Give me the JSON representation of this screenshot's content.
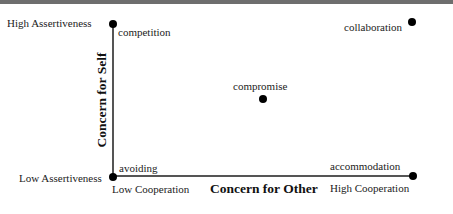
{
  "diagram": {
    "y_axis": {
      "title": "Concern for Self",
      "high_label": "High Assertiveness",
      "low_label": "Low Assertiveness"
    },
    "x_axis": {
      "title": "Concern for Other",
      "low_label": "Low Cooperation",
      "high_label": "High Cooperation"
    },
    "points": [
      {
        "name": "competition",
        "x": 0,
        "y": 1
      },
      {
        "name": "collaboration",
        "x": 1,
        "y": 1
      },
      {
        "name": "compromise",
        "x": 0.5,
        "y": 0.5
      },
      {
        "name": "avoiding",
        "x": 0,
        "y": 0
      },
      {
        "name": "accommodation",
        "x": 1,
        "y": 0
      }
    ]
  }
}
